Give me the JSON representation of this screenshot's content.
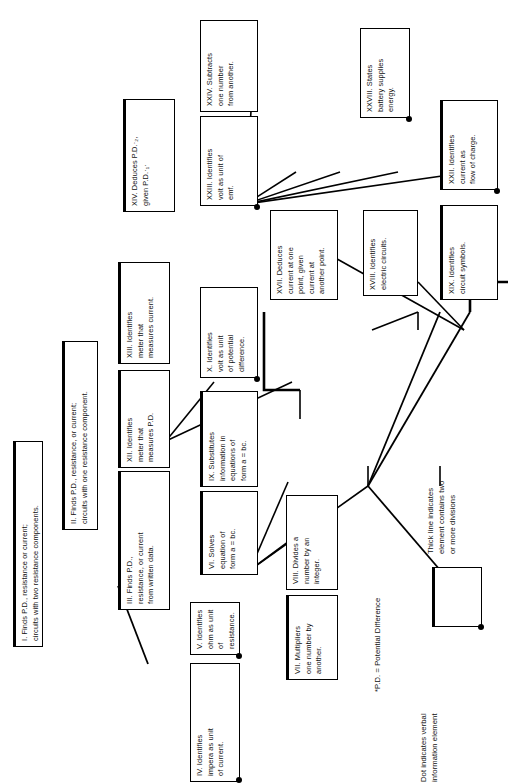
{
  "diagram": {
    "orientation": "rotated-90-ccw",
    "nodes": [
      {
        "id": "I",
        "label": "I.  Finds P.D., resistance or current;\ncircuits with two resistance components.",
        "thick": true,
        "dot": false
      },
      {
        "id": "II",
        "label": "II.  Finds P.D., resistance, or current;\ncircuits with one resistance component.",
        "thick": true,
        "dot": false
      },
      {
        "id": "III",
        "label": "III.  Finds P.D.,\nresistance, or current\nfrom written data.",
        "thick": true,
        "dot": false
      },
      {
        "id": "IV",
        "label": "IV.  Identifies\nimpera as unit\nof current.",
        "thick": false,
        "dot": true
      },
      {
        "id": "V",
        "label": "V.  Identifies\nohm as unit\nof resistance.",
        "thick": false,
        "dot": true
      },
      {
        "id": "VI",
        "label": "VI.  Solves\nequation of\nform a = bc.",
        "thick": true,
        "dot": false
      },
      {
        "id": "VII",
        "label": "VII.  Multipliers\none number by\nanother.",
        "thick": true,
        "dot": false
      },
      {
        "id": "VIII",
        "label": "VIII.  Divides a\nnumber by an\ninteger.",
        "thick": false,
        "dot": false
      },
      {
        "id": "IX",
        "label": "IX.  Substitutes\ninformation in\nequations of\nform a = bc.",
        "thick": true,
        "dot": false
      },
      {
        "id": "X",
        "label": "X.  Identifies\nvolt as unit\nof potential\ndifference.",
        "thick": false,
        "dot": true
      },
      {
        "id": "XII",
        "label": "XII.  Identifies\nmeter that\nmeasures P.D.",
        "thick": true,
        "dot": false
      },
      {
        "id": "XIII",
        "label": "XIII.  Identifies\nmeter that\nmeasures current.",
        "thick": true,
        "dot": false
      },
      {
        "id": "XIV",
        "label": "XIV.  Deduces P.D.·₂,\ngiven P.D.·₁·",
        "thick": true,
        "dot": false
      },
      {
        "id": "XVII",
        "label": "XVII.  Deduces\ncurrent at one\npoint, given\ncurrent at\nanother point.",
        "thick": false,
        "dot": false
      },
      {
        "id": "XVIII",
        "label": "XVIII.  Identifies\nelectric circuits.",
        "thick": false,
        "dot": false
      },
      {
        "id": "XIX",
        "label": "XIX.  Identifies\ncircuit symbols.",
        "thick": true,
        "dot": false
      },
      {
        "id": "XXII",
        "label": "XXII.  Identifies\ncurrent as\nflow of charge.",
        "thick": true,
        "dot": true
      },
      {
        "id": "XXIII",
        "label": "XXIII.  Identifies\nvolt as unit of\nemf.",
        "thick": false,
        "dot": true
      },
      {
        "id": "XXIV",
        "label": "XXIV.  Subtracts\none number\nfrom another.",
        "thick": false,
        "dot": false
      },
      {
        "id": "XXVIII",
        "label": "XXVIII.  States\nbattery supplies\nenergy.",
        "thick": false,
        "dot": true
      }
    ],
    "notes": {
      "footnote": "*P.D.  = Potential Difference",
      "legend_dot": "Dot indicates verbal\ninformation element",
      "legend_thick": "Thick line indicates\nelement contains two\nor more divisions"
    },
    "colors": {
      "ink": "#000000",
      "paper": "#ffffff"
    }
  }
}
